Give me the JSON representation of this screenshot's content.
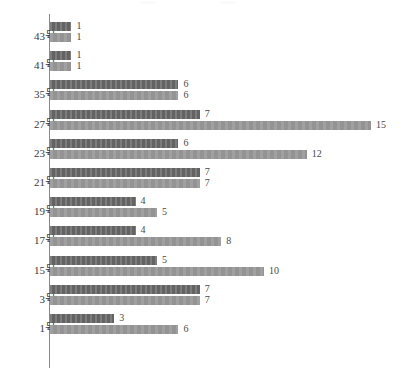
{
  "chart_data": {
    "type": "bar",
    "orientation": "horizontal",
    "title": "",
    "xlabel": "",
    "ylabel": "",
    "grid": false,
    "legend_position": "top",
    "xlim": [
      0,
      15
    ],
    "categories": [
      "43号",
      "41号",
      "35号",
      "27号",
      "23号",
      "21号",
      "19号",
      "17号",
      "15号",
      "3号",
      "1号"
    ],
    "series": [
      {
        "name": "",
        "color": "#6e6e6e",
        "values": [
          1,
          1,
          6,
          7,
          6,
          7,
          4,
          4,
          5,
          7,
          3
        ]
      },
      {
        "name": "",
        "color": "#9b9b9b",
        "values": [
          1,
          1,
          6,
          15,
          12,
          7,
          5,
          8,
          10,
          7,
          6
        ]
      }
    ],
    "data_labels": [
      [
        "1",
        "1"
      ],
      [
        "1",
        "1"
      ],
      [
        "6",
        "6"
      ],
      [
        "7",
        "15"
      ],
      [
        "6",
        "12"
      ],
      [
        "7",
        "7"
      ],
      [
        "4",
        "5"
      ],
      [
        "4",
        "8"
      ],
      [
        "5",
        "10"
      ],
      [
        "7",
        "7"
      ],
      [
        "3",
        "6"
      ]
    ]
  },
  "legend": {
    "entries": [
      {
        "label": "",
        "color": "#6e6e6e"
      },
      {
        "label": "",
        "color": "#9b9b9b"
      }
    ]
  }
}
